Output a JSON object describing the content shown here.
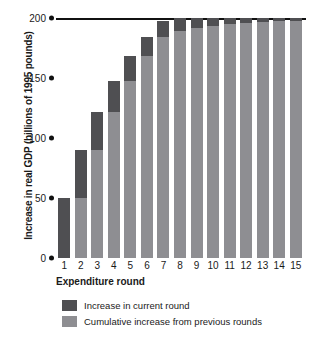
{
  "chart_data": {
    "type": "bar",
    "stacked": true,
    "title": "",
    "xlabel": "Expenditure round",
    "ylabel": "Increase in real GDP (billions of 1995 pounds)",
    "categories": [
      "1",
      "2",
      "3",
      "4",
      "5",
      "6",
      "7",
      "8",
      "9",
      "10",
      "11",
      "12",
      "13",
      "14",
      "15"
    ],
    "ylim": [
      0,
      200
    ],
    "yticks": [
      0,
      50,
      100,
      150,
      200
    ],
    "ytick_labels": [
      "0",
      "50",
      "100",
      "150",
      "200"
    ],
    "grid": false,
    "legend_position": "bottom-left",
    "series": [
      {
        "name": "Cumulative increase from previous rounds",
        "color": "#8e8e92",
        "values": [
          0,
          50,
          90,
          122,
          147.6,
          168.1,
          184.5,
          197.6,
          208.1,
          216.5,
          223.2,
          228.5,
          232.8,
          236.3,
          239.0
        ]
      },
      {
        "name": "Increase in current round",
        "color": "#4f4f52",
        "values": [
          50,
          40,
          32,
          25.6,
          20.5,
          16.4,
          13.1,
          10.5,
          8.4,
          6.7,
          5.4,
          4.3,
          3.4,
          2.8,
          2.2
        ]
      }
    ],
    "totals": [
      50,
      90,
      122,
      147.6,
      168.1,
      184.5,
      197.6,
      200,
      200,
      200,
      200,
      200,
      200,
      200,
      200
    ],
    "asymptote_line": 200,
    "annotations": []
  },
  "axis": {
    "y_title": "Increase in real GDP (billions of 1995 pounds)",
    "x_title": "Expenditure round"
  },
  "legend": {
    "items": [
      {
        "label": "Increase in current round",
        "color": "#4f4f52"
      },
      {
        "label": "Cumulative increase from previous rounds",
        "color": "#8e8e92"
      }
    ]
  },
  "colors": {
    "current": "#4f4f52",
    "cumulative": "#8e8e92",
    "axis": "#111111",
    "background": "#ffffff"
  }
}
